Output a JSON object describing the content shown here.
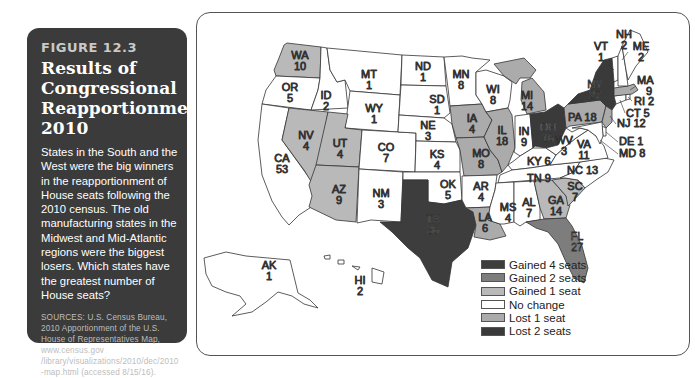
{
  "figure": {
    "label": "FIGURE 12.3",
    "title_lines": [
      "Results of",
      "Congressional",
      "Reapportionment,",
      "2010"
    ],
    "description": "States in the South and the West were the big winners in the reapportionment of House seats following the 2010 census. The old manufacturing states in the Midwest and Mid-Atlantic regions were the biggest losers. Which states have the greatest number of House seats?",
    "sources": "SOURCES: U.S. Census Bureau, 2010 Apportionment of the U.S. House of Representatives Map, www.census.gov /library/visualizations/2010/dec/2010 -map.html (accessed 8/15/16)."
  },
  "colors": {
    "gained4": "#3d3d3d",
    "gained2": "#7d7d7d",
    "gained1": "#b9b9b9",
    "nochange": "#ffffff",
    "lost1": "#ababab",
    "lost2": "#3a3a3a",
    "panel": "#3b3b3b"
  },
  "legend": [
    {
      "key": "gained4",
      "label": "Gained 4 seats",
      "color": "#3d3d3d"
    },
    {
      "key": "gained2",
      "label": "Gained 2 seats",
      "color": "#7d7d7d"
    },
    {
      "key": "gained1",
      "label": "Gained 1 seat",
      "color": "#b9b9b9"
    },
    {
      "key": "nochange",
      "label": "No change",
      "color": "#ffffff"
    },
    {
      "key": "lost1",
      "label": "Lost 1 seat",
      "color": "#ababab"
    },
    {
      "key": "lost2",
      "label": "Lost 2 seats",
      "color": "#3a3a3a"
    }
  ],
  "states": {
    "WA": {
      "seats": "10",
      "change": "gained1"
    },
    "OR": {
      "seats": "5",
      "change": "nochange"
    },
    "CA": {
      "seats": "53",
      "change": "nochange"
    },
    "ID": {
      "seats": "2",
      "change": "nochange"
    },
    "NV": {
      "seats": "4",
      "change": "gained1"
    },
    "MT": {
      "seats": "1",
      "change": "nochange"
    },
    "WY": {
      "seats": "1",
      "change": "nochange"
    },
    "UT": {
      "seats": "4",
      "change": "gained1"
    },
    "AZ": {
      "seats": "9",
      "change": "gained1"
    },
    "CO": {
      "seats": "7",
      "change": "nochange"
    },
    "NM": {
      "seats": "3",
      "change": "nochange"
    },
    "ND": {
      "seats": "1",
      "change": "nochange"
    },
    "SD": {
      "seats": "1",
      "change": "nochange"
    },
    "NE": {
      "seats": "3",
      "change": "nochange"
    },
    "KS": {
      "seats": "4",
      "change": "nochange"
    },
    "OK": {
      "seats": "5",
      "change": "nochange"
    },
    "TX": {
      "seats": "36",
      "change": "gained4"
    },
    "MN": {
      "seats": "8",
      "change": "nochange"
    },
    "IA": {
      "seats": "4",
      "change": "lost1"
    },
    "MO": {
      "seats": "8",
      "change": "lost1"
    },
    "AR": {
      "seats": "4",
      "change": "nochange"
    },
    "LA": {
      "seats": "6",
      "change": "lost1"
    },
    "WI": {
      "seats": "8",
      "change": "nochange"
    },
    "IL": {
      "seats": "18",
      "change": "lost1"
    },
    "MI": {
      "seats": "14",
      "change": "lost1"
    },
    "IN": {
      "seats": "9",
      "change": "nochange"
    },
    "OH": {
      "seats": "16",
      "change": "lost2"
    },
    "KY": {
      "seats": "6",
      "change": "nochange"
    },
    "TN": {
      "seats": "9",
      "change": "nochange"
    },
    "MS": {
      "seats": "4",
      "change": "nochange"
    },
    "AL": {
      "seats": "7",
      "change": "nochange"
    },
    "GA": {
      "seats": "14",
      "change": "gained1"
    },
    "FL": {
      "seats": "27",
      "change": "gained2"
    },
    "SC": {
      "seats": "7",
      "change": "gained1"
    },
    "NC": {
      "seats": "13",
      "change": "nochange"
    },
    "VA": {
      "seats": "11",
      "change": "nochange"
    },
    "WV": {
      "seats": "3",
      "change": "nochange"
    },
    "PA": {
      "seats": "18",
      "change": "lost1"
    },
    "NY": {
      "seats": "27",
      "change": "lost2"
    },
    "NJ": {
      "seats": "12",
      "change": "lost1"
    },
    "DE": {
      "seats": "1",
      "change": "nochange"
    },
    "MD": {
      "seats": "8",
      "change": "nochange"
    },
    "CT": {
      "seats": "5",
      "change": "nochange"
    },
    "RI": {
      "seats": "2",
      "change": "nochange"
    },
    "MA": {
      "seats": "9",
      "change": "lost1"
    },
    "VT": {
      "seats": "1",
      "change": "nochange"
    },
    "NH": {
      "seats": "2",
      "change": "nochange"
    },
    "ME": {
      "seats": "2",
      "change": "nochange"
    },
    "AK": {
      "seats": "1",
      "change": "nochange"
    },
    "HI": {
      "seats": "2",
      "change": "nochange"
    }
  }
}
